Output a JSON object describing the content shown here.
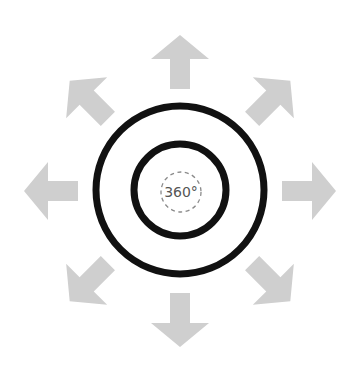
{
  "diagram": {
    "center_label": "360°",
    "colors": {
      "background": "#ffffff",
      "arrows": "#cfcfcf",
      "rings": "#111111",
      "dashed": "#8a8a8a",
      "label": "#555555"
    },
    "arrows": [
      {
        "direction": "up",
        "angle": 0
      },
      {
        "direction": "up-right",
        "angle": 45
      },
      {
        "direction": "right",
        "angle": 90
      },
      {
        "direction": "down-right",
        "angle": 135
      },
      {
        "direction": "down",
        "angle": 180
      },
      {
        "direction": "down-left",
        "angle": 225
      },
      {
        "direction": "left",
        "angle": 270
      },
      {
        "direction": "up-left",
        "angle": 315
      }
    ]
  }
}
